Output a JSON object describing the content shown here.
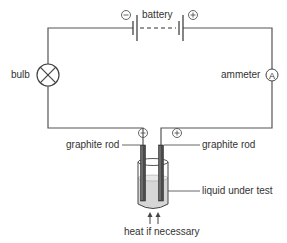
{
  "diagram": {
    "type": "electrical-circuit-electrolysis",
    "labels": {
      "battery": "battery",
      "bulb": "bulb",
      "ammeter": "ammeter",
      "ammeter_symbol": "A",
      "graphite_rod_left": "graphite rod",
      "graphite_rod_right": "graphite rod",
      "liquid": "liquid under test",
      "heat": "heat if necessary",
      "negative_sign": "−",
      "positive_sign": "+"
    },
    "colors": {
      "wire": "#555555",
      "text": "#333333",
      "liquid": "#d9d9d9",
      "rod": "#555555"
    }
  }
}
